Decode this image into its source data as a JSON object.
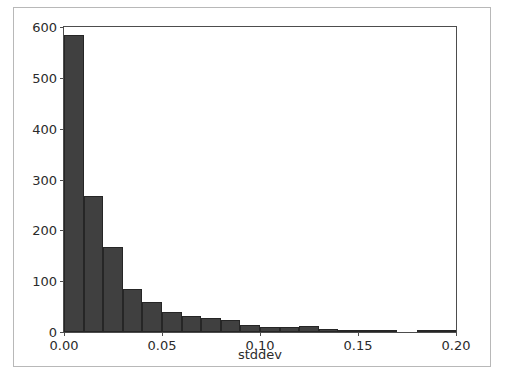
{
  "figure": {
    "background_color": "#ffffff",
    "border_color": "#b8b8b8",
    "axes_color": "#4d4d4d"
  },
  "clipped_caption": "—  ——  —— ———— ——",
  "chart_data": {
    "type": "bar",
    "title": "",
    "subtitle": "",
    "xlabel": "stddev",
    "ylabel": "",
    "xlim": [
      0.0,
      0.2
    ],
    "ylim": [
      0,
      600
    ],
    "grid": false,
    "legend": null,
    "bar_color": "#404040",
    "bar_edge_color": "#262626",
    "bin_width": 0.01,
    "xticks": [
      0.0,
      0.05,
      0.1,
      0.15,
      0.2
    ],
    "xtick_labels": [
      "0.00",
      "0.05",
      "0.10",
      "0.15",
      "0.20"
    ],
    "yticks": [
      0,
      100,
      200,
      300,
      400,
      500,
      600
    ],
    "ytick_labels": [
      "0",
      "100",
      "200",
      "300",
      "400",
      "500",
      "600"
    ],
    "bins": [
      [
        0.0,
        0.01
      ],
      [
        0.01,
        0.02
      ],
      [
        0.02,
        0.03
      ],
      [
        0.03,
        0.04
      ],
      [
        0.04,
        0.05
      ],
      [
        0.05,
        0.06
      ],
      [
        0.06,
        0.07
      ],
      [
        0.07,
        0.08
      ],
      [
        0.08,
        0.09
      ],
      [
        0.09,
        0.1
      ],
      [
        0.1,
        0.11
      ],
      [
        0.11,
        0.12
      ],
      [
        0.12,
        0.13
      ],
      [
        0.13,
        0.14
      ],
      [
        0.14,
        0.15
      ],
      [
        0.15,
        0.16
      ],
      [
        0.16,
        0.17
      ],
      [
        0.17,
        0.18
      ],
      [
        0.18,
        0.19
      ],
      [
        0.19,
        0.2
      ]
    ],
    "categories": [
      "0.000",
      "0.010",
      "0.020",
      "0.030",
      "0.040",
      "0.050",
      "0.060",
      "0.070",
      "0.080",
      "0.090",
      "0.100",
      "0.110",
      "0.120",
      "0.130",
      "0.140",
      "0.150",
      "0.160",
      "0.170",
      "0.180",
      "0.190"
    ],
    "values": [
      584,
      268,
      168,
      85,
      59,
      40,
      32,
      28,
      24,
      14,
      9,
      9,
      12,
      6,
      4,
      3,
      1,
      0,
      2,
      1
    ]
  }
}
